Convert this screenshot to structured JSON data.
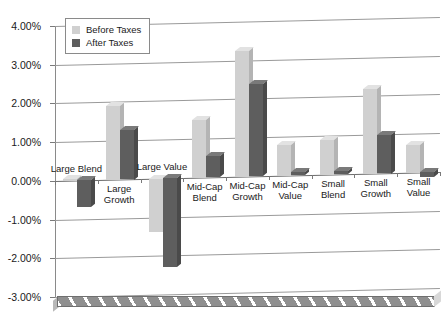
{
  "chart_data": {
    "type": "bar",
    "title": "",
    "subtitle": "",
    "xlabel": "",
    "ylabel": "",
    "ylim": [
      -3.0,
      4.0
    ],
    "ytick_step": 1.0,
    "yticks": [
      "4.00%",
      "3.00%",
      "2.00%",
      "1.00%",
      "0.00%",
      "-1.00%",
      "-2.00%",
      "-3.00%"
    ],
    "ytick_values": [
      4.0,
      3.0,
      2.0,
      1.0,
      0.0,
      -1.0,
      -2.0,
      -3.0
    ],
    "value_unit": "percent",
    "grid": true,
    "grid_axis": "y",
    "legend_position": "top-left",
    "style_3d": true,
    "categories": [
      "Large Blend",
      "Large Growth",
      "Large Value",
      "Mid-Cap Blend",
      "Mid-Cap Growth",
      "Mid-Cap Value",
      "Small Blend",
      "Small Growth",
      "Small Value"
    ],
    "series": [
      {
        "name": "Before Taxes",
        "color": "#d0d0d0",
        "values": [
          0.05,
          1.9,
          -1.38,
          1.48,
          3.25,
          0.8,
          0.9,
          2.18,
          0.72
        ]
      },
      {
        "name": "After Taxes",
        "color": "#5e5e5e",
        "values": [
          -0.7,
          1.28,
          -2.3,
          0.55,
          2.38,
          0.08,
          0.08,
          1.0,
          -0.12
        ]
      }
    ]
  },
  "legend": {
    "items": [
      {
        "label": "Before Taxes",
        "swatch": "before"
      },
      {
        "label": "After Taxes",
        "swatch": "after"
      }
    ]
  },
  "colors": {
    "before_taxes": "#d0d0d0",
    "after_taxes": "#5e5e5e",
    "gridline": "#9a9a9a",
    "zero_line": "#6b6b6b",
    "axis": "#8a8a8a",
    "text": "#1a1a1a",
    "floor": "#8f8f8f"
  }
}
